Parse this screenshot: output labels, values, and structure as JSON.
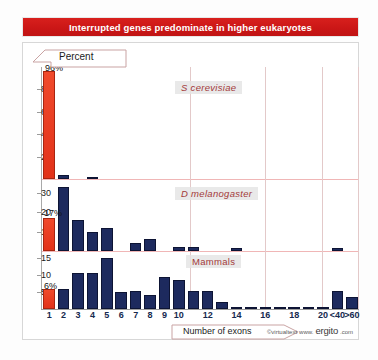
{
  "title": "Interrupted genes predominate in higher eukaryotes",
  "yaxis_banner_label": "Percent",
  "xaxis_banner_label": "Number of exons",
  "credit": {
    "copyright": "©virtualtext",
    "www": "www.",
    "brand": "ergito",
    "tld": ".com"
  },
  "colors": {
    "title_bar": "#ca1616",
    "first_bin_bar": "#e23219",
    "other_bars": "#1d2a5e",
    "species_label": "#a33a3a",
    "gridline": "#e3c9c9",
    "axis": "#9b9b9b"
  },
  "chart_data": {
    "type": "bar",
    "title": "Interrupted genes predominate in higher eukaryotes",
    "xlabel": "Number of exons",
    "ylabel": "Percent",
    "grid": true,
    "legend": "none",
    "categories": [
      "1",
      "2",
      "3",
      "4",
      "5",
      "6",
      "7",
      "8",
      "9",
      "10",
      "11",
      "12",
      "13",
      "14",
      "15",
      "16",
      "17",
      "18",
      "19",
      "20",
      "<40",
      ">60"
    ],
    "tick_labels": [
      "1",
      "2",
      "3",
      "4",
      "5",
      "6",
      "7",
      "8",
      "9",
      "10",
      "12",
      "14",
      "16",
      "18",
      "20",
      "<40",
      ">60"
    ],
    "tick_categories": [
      "1",
      "2",
      "3",
      "4",
      "5",
      "6",
      "7",
      "8",
      "9",
      "10",
      "12",
      "14",
      "16",
      "18",
      "20",
      "<40",
      ">60"
    ],
    "panels": [
      {
        "name": "S  cerevisiae",
        "label_style": "italic",
        "ylim": [
          0,
          100
        ],
        "yticks": [
          20,
          40,
          60,
          80
        ],
        "annotation": "96%",
        "annotation_category": "1",
        "values": [
          96,
          3.5,
          0,
          1.2,
          0,
          0,
          0,
          0,
          0,
          0,
          0,
          0,
          0,
          0,
          0,
          0,
          0,
          0,
          0,
          0,
          0,
          0
        ]
      },
      {
        "name": "D  melanogaster",
        "label_style": "italic",
        "ylim": [
          0,
          37
        ],
        "yticks": [
          10,
          20,
          30
        ],
        "annotation": "17%",
        "annotation_category": "1",
        "values": [
          17,
          33,
          16,
          10,
          12,
          0,
          4,
          6,
          0,
          2.2,
          2.2,
          0,
          0,
          1.8,
          0,
          0,
          0,
          0,
          0,
          0,
          1.8,
          0
        ]
      },
      {
        "name": "Mammals",
        "label_style": "plain",
        "ylim": [
          0,
          17
        ],
        "yticks": [
          5,
          10,
          15
        ],
        "annotation": "6%",
        "annotation_category": "1",
        "values": [
          6,
          6,
          10.5,
          10.5,
          15,
          5,
          5.2,
          4,
          9.3,
          8.6,
          5.2,
          5.2,
          2,
          0.6,
          0.6,
          0.4,
          0.5,
          0.6,
          0.1,
          0.1,
          5.2,
          3.5
        ]
      }
    ],
    "extra_small_bars": {
      "mammals_after_40": 1.0,
      "mammals_after_60": 0.8
    }
  }
}
